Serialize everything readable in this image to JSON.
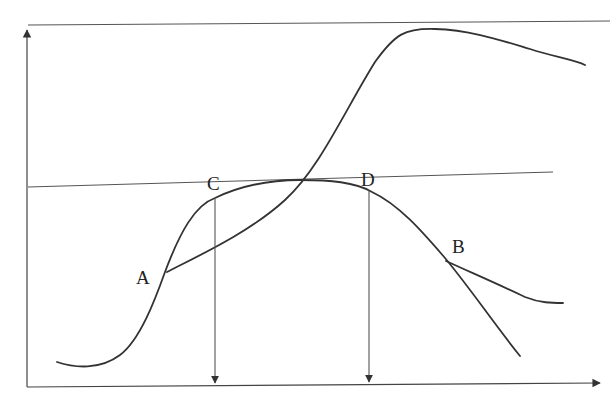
{
  "diagram": {
    "type": "curve-diagram",
    "labels": {
      "A": "A",
      "B": "B",
      "C": "C",
      "D": "D"
    },
    "elements": {
      "y_axis": "vertical axis with upward arrow",
      "x_axis": "horizontal axis with rightward arrow",
      "top_line": "horizontal reference line near top",
      "mid_line": "near-horizontal reference line through curve peak",
      "bell_curve": "rises from lower-left, peaks near middle, falls to lower-right",
      "s_curve": "starts at A, rises steeply, peaks near top-right, then declines",
      "branch_B": "flatter branch leaving main curve at B to the right",
      "drop_C": "vertical arrow from curve below C down to x-axis",
      "drop_D": "vertical arrow from curve below D down to x-axis"
    },
    "colors": {
      "line": "#333333",
      "background": "#ffffff"
    }
  }
}
